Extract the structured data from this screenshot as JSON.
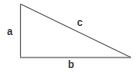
{
  "figure": {
    "name": "right-triangle-diagram",
    "background_color": "#ffffff",
    "width": 138,
    "height": 76,
    "stroke_color_legs": "#6e6e6e",
    "stroke_color_hypotenuse": "#6e6e6e",
    "stroke_color_base": "#8c8c8c",
    "label_color": "#3a3a3a",
    "vertices": {
      "apex": [
        20,
        4
      ],
      "right_angle": [
        20,
        57
      ],
      "base_right": [
        131,
        57
      ]
    },
    "labels": {
      "vertical_leg": "a",
      "horizontal_leg": "b",
      "hypotenuse": "c"
    }
  }
}
